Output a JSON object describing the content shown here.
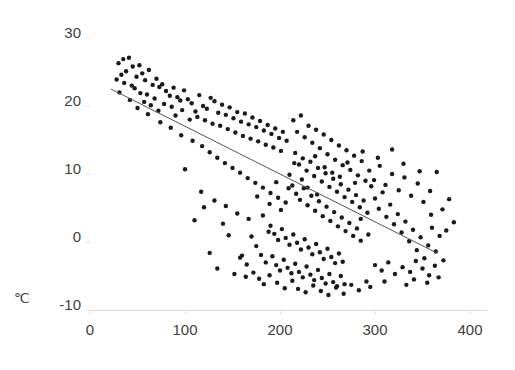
{
  "chart_data": {
    "type": "scatter",
    "title": "",
    "subtitle": "",
    "xlabel": "",
    "ylabel": "℃",
    "xlim": [
      0,
      400
    ],
    "ylim": [
      -10,
      30
    ],
    "xticks": [
      0,
      100,
      200,
      300,
      400
    ],
    "yticks": [
      -10,
      0,
      10,
      20,
      30
    ],
    "xtick_labels": [
      "0",
      "100",
      "200",
      "300",
      "400"
    ],
    "ytick_labels": [
      "-10",
      "0",
      "10",
      "20",
      "30"
    ],
    "grid": false,
    "legend": null,
    "marker": {
      "shape": "circle",
      "color": "#1a1a1a",
      "size_px": 4.4
    },
    "trendline": {
      "type": "linear",
      "color": "#555555",
      "width_px": 1,
      "x_start": 22,
      "y_start": 22.5,
      "x_end": 365,
      "y_end": -1.6,
      "slope": -0.0703,
      "intercept": 24.05
    },
    "series": [
      {
        "name": "observations",
        "n_points": 283,
        "points": [
          [
            30,
            26.3
          ],
          [
            35,
            26.9
          ],
          [
            33,
            24.6
          ],
          [
            38,
            25.1
          ],
          [
            41,
            27.1
          ],
          [
            45,
            25.8
          ],
          [
            36,
            23.4
          ],
          [
            44,
            23.0
          ],
          [
            31,
            22.0
          ],
          [
            49,
            24.3
          ],
          [
            52,
            26.0
          ],
          [
            55,
            24.8
          ],
          [
            47,
            22.6
          ],
          [
            58,
            23.8
          ],
          [
            53,
            21.9
          ],
          [
            62,
            25.3
          ],
          [
            66,
            23.1
          ],
          [
            60,
            21.7
          ],
          [
            57,
            20.6
          ],
          [
            70,
            24.0
          ],
          [
            73,
            22.8
          ],
          [
            68,
            21.1
          ],
          [
            64,
            20.1
          ],
          [
            76,
            23.2
          ],
          [
            80,
            22.2
          ],
          [
            84,
            21.5
          ],
          [
            78,
            20.3
          ],
          [
            72,
            19.3
          ],
          [
            88,
            22.7
          ],
          [
            92,
            21.3
          ],
          [
            86,
            19.9
          ],
          [
            95,
            20.8
          ],
          [
            99,
            22.3
          ],
          [
            103,
            21.0
          ],
          [
            97,
            19.4
          ],
          [
            90,
            18.6
          ],
          [
            107,
            20.4
          ],
          [
            111,
            19.2
          ],
          [
            105,
            18.0
          ],
          [
            115,
            21.6
          ],
          [
            119,
            20.0
          ],
          [
            113,
            18.4
          ],
          [
            123,
            19.6
          ],
          [
            127,
            21.2
          ],
          [
            121,
            17.9
          ],
          [
            131,
            20.7
          ],
          [
            135,
            19.0
          ],
          [
            129,
            17.4
          ],
          [
            139,
            20.2
          ],
          [
            143,
            18.7
          ],
          [
            137,
            17.1
          ],
          [
            147,
            19.8
          ],
          [
            151,
            18.2
          ],
          [
            145,
            16.6
          ],
          [
            155,
            19.1
          ],
          [
            159,
            17.7
          ],
          [
            153,
            16.1
          ],
          [
            163,
            18.9
          ],
          [
            167,
            17.3
          ],
          [
            161,
            15.6
          ],
          [
            171,
            18.3
          ],
          [
            175,
            16.9
          ],
          [
            169,
            15.2
          ],
          [
            179,
            17.8
          ],
          [
            183,
            16.4
          ],
          [
            177,
            14.8
          ],
          [
            187,
            17.2
          ],
          [
            191,
            15.9
          ],
          [
            185,
            14.3
          ],
          [
            195,
            16.7
          ],
          [
            199,
            15.3
          ],
          [
            193,
            13.9
          ],
          [
            203,
            16.2
          ],
          [
            207,
            14.9
          ],
          [
            201,
            13.4
          ],
          [
            28,
            23.9
          ],
          [
            42,
            20.9
          ],
          [
            50,
            19.7
          ],
          [
            61,
            18.8
          ],
          [
            74,
            17.6
          ],
          [
            85,
            16.8
          ],
          [
            96,
            15.7
          ],
          [
            108,
            14.9
          ],
          [
            118,
            14.1
          ],
          [
            126,
            13.2
          ],
          [
            134,
            12.4
          ],
          [
            142,
            11.6
          ],
          [
            150,
            10.9
          ],
          [
            158,
            10.2
          ],
          [
            166,
            9.4
          ],
          [
            174,
            8.7
          ],
          [
            182,
            8.0
          ],
          [
            190,
            7.2
          ],
          [
            198,
            6.5
          ],
          [
            206,
            5.8
          ],
          [
            214,
            17.9
          ],
          [
            218,
            16.2
          ],
          [
            222,
            18.6
          ],
          [
            226,
            15.4
          ],
          [
            230,
            17.1
          ],
          [
            234,
            14.6
          ],
          [
            238,
            16.5
          ],
          [
            242,
            13.8
          ],
          [
            246,
            15.8
          ],
          [
            250,
            12.9
          ],
          [
            254,
            15.0
          ],
          [
            258,
            12.1
          ],
          [
            262,
            14.2
          ],
          [
            266,
            11.3
          ],
          [
            270,
            13.5
          ],
          [
            274,
            10.6
          ],
          [
            278,
            12.7
          ],
          [
            282,
            9.8
          ],
          [
            286,
            11.9
          ],
          [
            290,
            9.0
          ],
          [
            216,
            13.1
          ],
          [
            220,
            11.4
          ],
          [
            224,
            12.3
          ],
          [
            228,
            10.5
          ],
          [
            232,
            11.8
          ],
          [
            236,
            9.7
          ],
          [
            240,
            10.9
          ],
          [
            244,
            8.9
          ],
          [
            248,
            10.1
          ],
          [
            252,
            8.1
          ],
          [
            256,
            9.3
          ],
          [
            260,
            7.4
          ],
          [
            264,
            8.5
          ],
          [
            268,
            6.6
          ],
          [
            272,
            7.7
          ],
          [
            276,
            5.9
          ],
          [
            280,
            6.9
          ],
          [
            284,
            5.1
          ],
          [
            288,
            6.1
          ],
          [
            292,
            4.3
          ],
          [
            210,
            9.9
          ],
          [
            213,
            8.3
          ],
          [
            217,
            7.1
          ],
          [
            221,
            6.2
          ],
          [
            225,
            7.9
          ],
          [
            229,
            5.4
          ],
          [
            233,
            6.8
          ],
          [
            237,
            4.6
          ],
          [
            241,
            6.0
          ],
          [
            245,
            3.8
          ],
          [
            249,
            5.2
          ],
          [
            253,
            3.1
          ],
          [
            257,
            4.4
          ],
          [
            261,
            2.3
          ],
          [
            265,
            3.6
          ],
          [
            269,
            1.6
          ],
          [
            273,
            2.8
          ],
          [
            277,
            0.9
          ],
          [
            281,
            2.0
          ],
          [
            285,
            0.2
          ],
          [
            190,
            2.4
          ],
          [
            194,
            1.2
          ],
          [
            198,
            0.3
          ],
          [
            202,
            1.9
          ],
          [
            206,
            0.6
          ],
          [
            210,
            -0.4
          ],
          [
            214,
            1.1
          ],
          [
            218,
            -0.1
          ],
          [
            222,
            -1.1
          ],
          [
            226,
            0.4
          ],
          [
            230,
            -0.8
          ],
          [
            234,
            -1.8
          ],
          [
            238,
            -0.3
          ],
          [
            242,
            -1.5
          ],
          [
            246,
            -2.5
          ],
          [
            250,
            -1.0
          ],
          [
            254,
            -2.2
          ],
          [
            258,
            -3.1
          ],
          [
            262,
            -1.7
          ],
          [
            266,
            -2.9
          ],
          [
            170,
            0.8
          ],
          [
            175,
            -0.6
          ],
          [
            180,
            -1.9
          ],
          [
            185,
            -3.0
          ],
          [
            188,
            1.5
          ],
          [
            192,
            -2.1
          ],
          [
            196,
            -3.4
          ],
          [
            200,
            -4.2
          ],
          [
            204,
            -2.6
          ],
          [
            208,
            -3.8
          ],
          [
            212,
            -4.6
          ],
          [
            216,
            -3.2
          ],
          [
            220,
            -4.4
          ],
          [
            224,
            -5.2
          ],
          [
            228,
            -3.6
          ],
          [
            232,
            -4.8
          ],
          [
            236,
            -5.6
          ],
          [
            240,
            -4.1
          ],
          [
            244,
            -5.3
          ],
          [
            248,
            -6.1
          ],
          [
            252,
            -4.7
          ],
          [
            256,
            -5.9
          ],
          [
            260,
            -6.5
          ],
          [
            264,
            -5.0
          ],
          [
            268,
            -6.2
          ],
          [
            160,
            -2.0
          ],
          [
            165,
            -3.3
          ],
          [
            172,
            -4.5
          ],
          [
            178,
            -5.4
          ],
          [
            183,
            -6.2
          ],
          [
            189,
            -4.9
          ],
          [
            197,
            -6.0
          ],
          [
            205,
            -6.8
          ],
          [
            213,
            -5.7
          ],
          [
            219,
            -6.9
          ],
          [
            227,
            -7.4
          ],
          [
            235,
            -6.4
          ],
          [
            243,
            -7.2
          ],
          [
            251,
            -7.8
          ],
          [
            259,
            -6.7
          ],
          [
            267,
            -7.6
          ],
          [
            275,
            -6.3
          ],
          [
            283,
            -7.1
          ],
          [
            291,
            -5.8
          ],
          [
            295,
            -6.6
          ],
          [
            296,
            8.2
          ],
          [
            300,
            6.4
          ],
          [
            304,
            4.9
          ],
          [
            308,
            7.3
          ],
          [
            312,
            3.7
          ],
          [
            316,
            5.5
          ],
          [
            320,
            2.6
          ],
          [
            324,
            4.1
          ],
          [
            328,
            1.4
          ],
          [
            332,
            3.0
          ],
          [
            336,
            0.1
          ],
          [
            340,
            1.8
          ],
          [
            344,
            -1.2
          ],
          [
            348,
            0.7
          ],
          [
            352,
            -2.4
          ],
          [
            356,
            -0.5
          ],
          [
            360,
            2.1
          ],
          [
            364,
            -1.4
          ],
          [
            368,
            0.9
          ],
          [
            372,
            -2.7
          ],
          [
            294,
            10.5
          ],
          [
            299,
            9.1
          ],
          [
            305,
            11.2
          ],
          [
            311,
            8.4
          ],
          [
            318,
            10.0
          ],
          [
            325,
            7.6
          ],
          [
            331,
            9.5
          ],
          [
            338,
            6.8
          ],
          [
            345,
            8.6
          ],
          [
            351,
            5.9
          ],
          [
            358,
            7.5
          ],
          [
            365,
            10.3
          ],
          [
            371,
            4.8
          ],
          [
            378,
            6.3
          ],
          [
            383,
            2.9
          ],
          [
            300,
            -3.4
          ],
          [
            307,
            -4.2
          ],
          [
            314,
            -3.0
          ],
          [
            321,
            -4.7
          ],
          [
            329,
            -3.7
          ],
          [
            337,
            -4.4
          ],
          [
            343,
            -2.8
          ],
          [
            350,
            -3.9
          ],
          [
            357,
            -4.9
          ],
          [
            363,
            -3.5
          ],
          [
            110,
            3.2
          ],
          [
            126,
            -1.6
          ],
          [
            140,
            2.7
          ],
          [
            134,
            -3.9
          ],
          [
            152,
            -4.7
          ],
          [
            146,
            1.0
          ],
          [
            158,
            -2.3
          ],
          [
            164,
            -5.1
          ],
          [
            120,
            5.1
          ],
          [
            100,
            10.7
          ],
          [
            117,
            7.4
          ],
          [
            131,
            6.1
          ],
          [
            143,
            5.3
          ],
          [
            155,
            4.2
          ],
          [
            167,
            3.4
          ],
          [
            182,
            3.9
          ],
          [
            176,
            6.7
          ],
          [
            189,
            5.6
          ],
          [
            201,
            4.7
          ],
          [
            196,
            8.8
          ],
          [
            209,
            7.9
          ],
          [
            223,
            9.2
          ],
          [
            215,
            11.6
          ],
          [
            237,
            12.6
          ],
          [
            229,
            8.0
          ],
          [
            247,
            11.0
          ],
          [
            239,
            7.0
          ],
          [
            255,
            10.2
          ],
          [
            263,
            9.6
          ],
          [
            271,
            11.7
          ],
          [
            279,
            8.7
          ],
          [
            287,
            13.3
          ],
          [
            285,
            3.4
          ],
          [
            293,
            1.1
          ],
          [
            303,
            12.4
          ],
          [
            318,
            13.6
          ],
          [
            330,
            11.5
          ],
          [
            347,
            10.4
          ],
          [
            359,
            4.0
          ],
          [
            375,
            1.7
          ],
          [
            367,
            -5.2
          ],
          [
            355,
            -6.0
          ],
          [
            341,
            -5.5
          ],
          [
            333,
            -6.3
          ],
          [
            310,
            -5.8
          ]
        ]
      }
    ]
  },
  "axis": {
    "unit_label": "℃"
  }
}
